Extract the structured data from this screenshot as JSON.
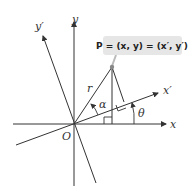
{
  "diagram": {
    "point_label": "P = (x, y) = (x′, y′)",
    "labels": {
      "x": "x",
      "y": "y",
      "x_prime": "x′",
      "y_prime": "y′",
      "origin": "O",
      "r": "r",
      "alpha": "α",
      "theta": "θ"
    },
    "colors": {
      "lines": "#333333",
      "label_box": "#e6e6e6",
      "point": "#888888"
    }
  }
}
